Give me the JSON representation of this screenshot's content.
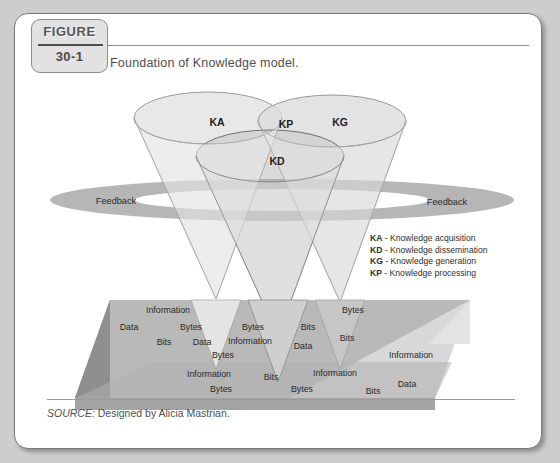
{
  "figure": {
    "tab_word": "FIGURE",
    "number": "30-1",
    "caption": "Foundation of Knowledge model."
  },
  "source": {
    "label": "SOURCE:",
    "text": "Designed by Alicia Mastrian."
  },
  "legend": [
    {
      "code": "KA",
      "sep": " - ",
      "text": "Knowledge acquisition"
    },
    {
      "code": "KD",
      "sep": " - ",
      "text": "Knowledge dissemination"
    },
    {
      "code": "KG",
      "sep": " - ",
      "text": "Knowledge generation"
    },
    {
      "code": "KP",
      "sep": " - ",
      "text": "Knowledge processing"
    }
  ],
  "diagram": {
    "type": "conceptual-3d-model",
    "cone_labels": [
      {
        "id": "KA",
        "text": "KA",
        "x": 202,
        "y": 108
      },
      {
        "id": "KP",
        "text": "KP",
        "x": 271,
        "y": 110
      },
      {
        "id": "KG",
        "text": "KG",
        "x": 325,
        "y": 108
      },
      {
        "id": "KD",
        "text": "KD",
        "x": 262,
        "y": 147
      }
    ],
    "feedback_labels": [
      {
        "text": "Feedback",
        "x": 101,
        "y": 187
      },
      {
        "text": "Feedback",
        "x": 432,
        "y": 188
      }
    ],
    "base_words": [
      {
        "text": "Information",
        "x": 153,
        "y": 296
      },
      {
        "text": "Bytes",
        "x": 338,
        "y": 296
      },
      {
        "text": "Data",
        "x": 114,
        "y": 313
      },
      {
        "text": "Bytes",
        "x": 176,
        "y": 313
      },
      {
        "text": "Bytes",
        "x": 238,
        "y": 313
      },
      {
        "text": "Bits",
        "x": 293,
        "y": 313
      },
      {
        "text": "Bits",
        "x": 149,
        "y": 328
      },
      {
        "text": "Data",
        "x": 187,
        "y": 328
      },
      {
        "text": "Information",
        "x": 235,
        "y": 327
      },
      {
        "text": "Data",
        "x": 288,
        "y": 332
      },
      {
        "text": "Bits",
        "x": 332,
        "y": 324
      },
      {
        "text": "Bytes",
        "x": 208,
        "y": 341
      },
      {
        "text": "Information",
        "x": 396,
        "y": 341
      },
      {
        "text": "Information",
        "x": 194,
        "y": 360
      },
      {
        "text": "Bits",
        "x": 256,
        "y": 363
      },
      {
        "text": "Information",
        "x": 320,
        "y": 359
      },
      {
        "text": "Bytes",
        "x": 206,
        "y": 375
      },
      {
        "text": "Bytes",
        "x": 287,
        "y": 375
      },
      {
        "text": "Bits",
        "x": 358,
        "y": 377
      },
      {
        "text": "Data",
        "x": 392,
        "y": 370
      }
    ]
  },
  "colors": {
    "page_background": "#cdcdcd",
    "card": "#ffffff",
    "card_border": "#7a7a7a",
    "tab_fill": "#e2e2e2",
    "cone_light": "#e8e8e8",
    "cone_mid": "#d6d6d6",
    "cone_outline": "#9a9a9a",
    "feedback_ring": "#a8a8a8",
    "slab_top": "#b8b8b8",
    "slab_side": "#8a8a8a",
    "slab_light": "#dcdcdc",
    "text": "#2a2a2a"
  }
}
